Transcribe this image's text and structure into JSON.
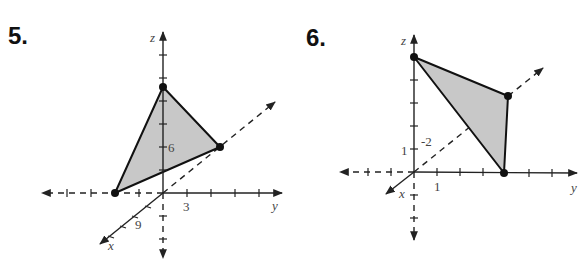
{
  "figures": [
    {
      "number": "5.",
      "axis_labels": {
        "x": "x",
        "y": "y",
        "z": "z"
      },
      "tick_labels": {
        "z": "6",
        "y": "3",
        "x": "9"
      },
      "vertices_description": [
        "on x-axis (negative y side drawn)",
        "on z-axis",
        "on y-axis"
      ]
    },
    {
      "number": "6.",
      "axis_labels": {
        "x": "x",
        "y": "y",
        "z": "z"
      },
      "tick_labels": {
        "z": "1",
        "y": "1",
        "x": "-2"
      },
      "vertices_description": [
        "on z-axis",
        "on y-axis",
        "in x<0 region (behind)"
      ]
    }
  ],
  "colors": {
    "fill": "#c8c8c8",
    "stroke": "#111111"
  }
}
